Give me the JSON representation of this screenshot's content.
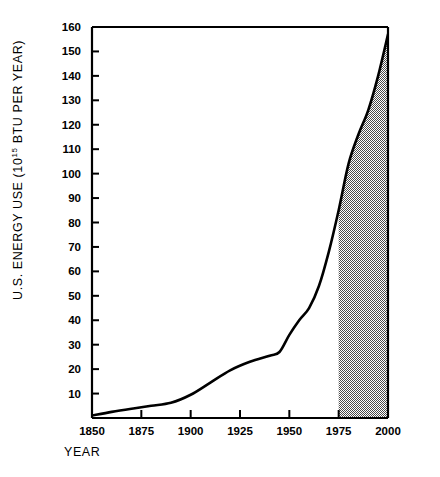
{
  "chart_data": {
    "type": "area",
    "title": "",
    "xlabel": "YEAR",
    "ylabel_prefix": "U.S. ENERGY USE (10",
    "ylabel_exponent": "15",
    "ylabel_suffix": " BTU PER YEAR)",
    "ylabel_full": "U.S. ENERGY USE (10^15 BTU PER YEAR)",
    "xlim": [
      1850,
      2000
    ],
    "ylim": [
      0,
      160
    ],
    "xticks": [
      1850,
      1875,
      1900,
      1925,
      1950,
      1975,
      2000
    ],
    "xtick_labels": [
      "1850",
      "1875",
      "1900",
      "1925",
      "1950",
      "1975",
      "2000"
    ],
    "yticks": [
      0,
      10,
      20,
      30,
      40,
      50,
      60,
      70,
      80,
      90,
      100,
      110,
      120,
      130,
      140,
      150,
      160
    ],
    "ytick_labels": [
      "",
      "10",
      "20",
      "30",
      "40",
      "50",
      "60",
      "70",
      "80",
      "90",
      "100",
      "110",
      "120",
      "130",
      "140",
      "150",
      "160"
    ],
    "grid": false,
    "legend": "none",
    "line_color": "#000000",
    "shade_color": "#808080",
    "shade_region": {
      "label": "projected",
      "x_start": 1975,
      "x_end": 2000,
      "fill": "hatched-gray"
    },
    "x": [
      1850,
      1860,
      1870,
      1880,
      1890,
      1900,
      1910,
      1920,
      1930,
      1940,
      1945,
      1950,
      1955,
      1960,
      1965,
      1970,
      1975,
      1980,
      1985,
      1990,
      1995,
      2000
    ],
    "values": [
      1,
      2.5,
      3.8,
      5.0,
      6.2,
      9.5,
      14.5,
      19.5,
      23.0,
      25.5,
      27.0,
      34.0,
      40.0,
      45.0,
      54.0,
      68.0,
      85.0,
      104.0,
      116.0,
      126.0,
      140.0,
      157.0
    ],
    "series": [
      {
        "name": "U.S. energy use",
        "values": [
          1,
          2.5,
          3.8,
          5.0,
          6.2,
          9.5,
          14.5,
          19.5,
          23.0,
          25.5,
          27.0,
          34.0,
          40.0,
          45.0,
          54.0,
          68.0,
          85.0,
          104.0,
          116.0,
          126.0,
          140.0,
          157.0
        ]
      }
    ]
  }
}
